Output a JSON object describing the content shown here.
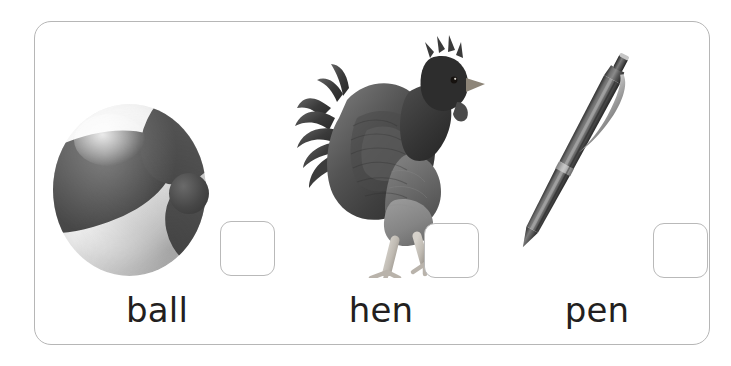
{
  "worksheet": {
    "card_border_color": "#b6b6b6",
    "background_color": "#ffffff",
    "text_color": "#231f20",
    "box_border_color": "#b9b9b9",
    "items": [
      {
        "word": "ball",
        "picture": "beach-ball-photo",
        "answer_box_value": "",
        "answer_box_placeholder": ""
      },
      {
        "word": "hen",
        "picture": "hen-photo",
        "answer_box_value": "",
        "answer_box_placeholder": ""
      },
      {
        "word": "pen",
        "picture": "pen-photo",
        "answer_box_value": "",
        "answer_box_placeholder": ""
      }
    ]
  }
}
